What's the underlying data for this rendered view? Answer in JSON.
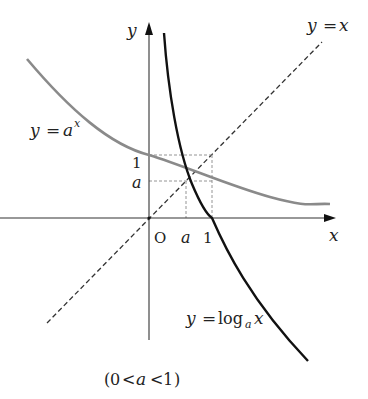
{
  "diagram": {
    "axes": {
      "x_label": "x",
      "y_label": "y",
      "origin_label": "O"
    },
    "ticks": {
      "x_a": "a",
      "x_one": "1",
      "y_one": "1",
      "y_a": "a"
    },
    "curves": [
      {
        "id": "exp",
        "label_lhs": "y",
        "label_eq": "=",
        "label_rhs": "a",
        "label_sup": "x",
        "color": "#8a8a8a",
        "style": "solid"
      },
      {
        "id": "log",
        "label_lhs": "y",
        "label_eq": "=",
        "label_func": "log",
        "label_sub": "a",
        "label_arg": "x",
        "color": "#111111",
        "style": "solid"
      },
      {
        "id": "identity",
        "label_lhs": "y",
        "label_eq": "=",
        "label_rhs": "x",
        "color": "#333333",
        "style": "dashed"
      }
    ],
    "condition": {
      "open": "(",
      "zero": "0",
      "lt1": "<",
      "a": "a",
      "lt2": "<",
      "one": "1",
      "close": ")"
    },
    "parameter_a": 0.59
  }
}
